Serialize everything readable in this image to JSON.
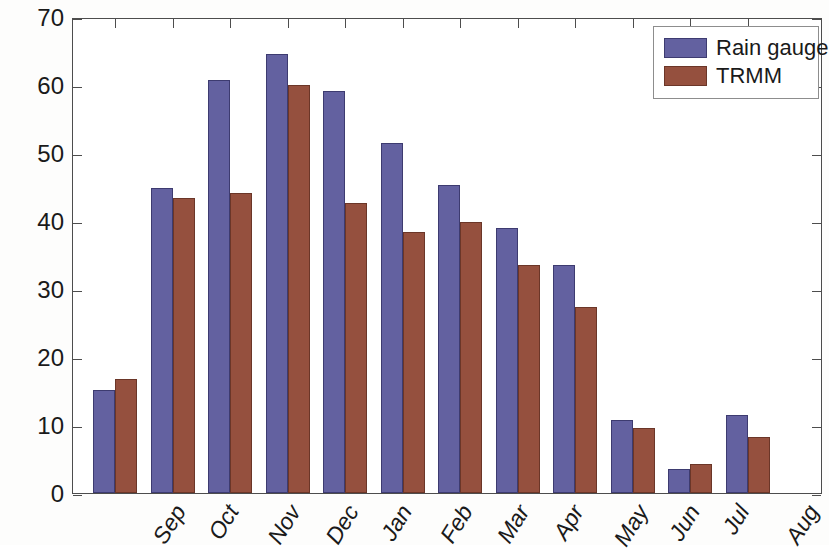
{
  "chart_data": {
    "type": "bar",
    "title": "",
    "subtitle": "",
    "xlabel": "",
    "ylabel": "Rainfall (mm)",
    "categories": [
      "Sep",
      "Oct",
      "Nov",
      "Dec",
      "Jan",
      "Feb",
      "Mar",
      "Apr",
      "May",
      "Jun",
      "Jul",
      "Aug"
    ],
    "series": [
      {
        "name": "Rain gauge",
        "color": "#6361a0",
        "values": [
          15.2,
          44.8,
          60.8,
          64.6,
          59.1,
          51.4,
          45.3,
          39.0,
          33.6,
          10.8,
          3.5,
          11.5
        ]
      },
      {
        "name": "TRMM",
        "color": "#95503e",
        "values": [
          16.8,
          43.4,
          44.1,
          60.0,
          42.7,
          38.4,
          39.9,
          33.6,
          27.4,
          9.5,
          4.3,
          8.3
        ]
      }
    ],
    "ylim": [
      0,
      70
    ],
    "yticks": [
      0,
      10,
      20,
      30,
      40,
      50,
      60,
      70
    ],
    "ytick_labels": [
      "0",
      "10",
      "20",
      "30",
      "40",
      "50",
      "60",
      "70"
    ],
    "grid": false,
    "legend_position": "top-right",
    "annotations": []
  },
  "axes": {
    "y_title": "Rainfall (mm)"
  },
  "legend": {
    "entries": [
      {
        "label": "Rain gauge",
        "color": "#6361a0"
      },
      {
        "label": "TRMM",
        "color": "#95503e"
      }
    ]
  }
}
